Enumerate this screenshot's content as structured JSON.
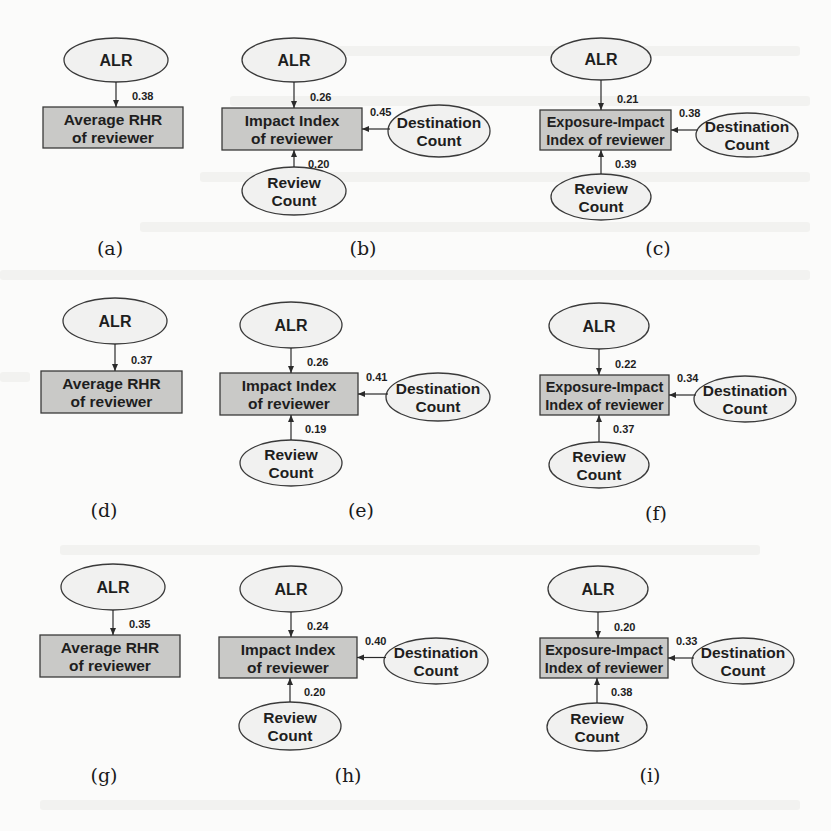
{
  "figure": {
    "colors": {
      "ellipse_fill": "#f1f1f0",
      "box_fill": "#c9c9c7",
      "stroke": "#3a3a3a",
      "text": "#1e1e1e",
      "background": "#fbfbfa"
    },
    "panels": [
      {
        "id": "a",
        "caption": "(a)",
        "outcome_lines": [
          "Average RHR",
          "of reviewer"
        ],
        "nodes": {
          "alr": "ALR"
        },
        "coefficients": {
          "alr": "0.38"
        }
      },
      {
        "id": "b",
        "caption": "(b)",
        "outcome_lines": [
          "Impact Index",
          "of reviewer"
        ],
        "nodes": {
          "alr": "ALR",
          "destination": [
            "Destination",
            "Count"
          ],
          "review": [
            "Review",
            "Count"
          ]
        },
        "coefficients": {
          "alr": "0.26",
          "destination": "0.45",
          "review": "0.20"
        }
      },
      {
        "id": "c",
        "caption": "(c)",
        "outcome_lines": [
          "Exposure-Impact",
          "Index of reviewer"
        ],
        "nodes": {
          "alr": "ALR",
          "destination": [
            "Destination",
            "Count"
          ],
          "review": [
            "Review",
            "Count"
          ]
        },
        "coefficients": {
          "alr": "0.21",
          "destination": "0.38",
          "review": "0.39"
        }
      },
      {
        "id": "d",
        "caption": "(d)",
        "outcome_lines": [
          "Average RHR",
          "of reviewer"
        ],
        "nodes": {
          "alr": "ALR"
        },
        "coefficients": {
          "alr": "0.37"
        }
      },
      {
        "id": "e",
        "caption": "(e)",
        "outcome_lines": [
          "Impact Index",
          "of reviewer"
        ],
        "nodes": {
          "alr": "ALR",
          "destination": [
            "Destination",
            "Count"
          ],
          "review": [
            "Review",
            "Count"
          ]
        },
        "coefficients": {
          "alr": "0.26",
          "destination": "0.41",
          "review": "0.19"
        }
      },
      {
        "id": "f",
        "caption": "(f)",
        "outcome_lines": [
          "Exposure-Impact",
          "Index of reviewer"
        ],
        "nodes": {
          "alr": "ALR",
          "destination": [
            "Destination",
            "Count"
          ],
          "review": [
            "Review",
            "Count"
          ]
        },
        "coefficients": {
          "alr": "0.22",
          "destination": "0.34",
          "review": "0.37"
        }
      },
      {
        "id": "g",
        "caption": "(g)",
        "outcome_lines": [
          "Average RHR",
          "of reviewer"
        ],
        "nodes": {
          "alr": "ALR"
        },
        "coefficients": {
          "alr": "0.35"
        }
      },
      {
        "id": "h",
        "caption": "(h)",
        "outcome_lines": [
          "Impact Index",
          "of reviewer"
        ],
        "nodes": {
          "alr": "ALR",
          "destination": [
            "Destination",
            "Count"
          ],
          "review": [
            "Review",
            "Count"
          ]
        },
        "coefficients": {
          "alr": "0.24",
          "destination": "0.40",
          "review": "0.20"
        }
      },
      {
        "id": "i",
        "caption": "(i)",
        "outcome_lines": [
          "Exposure-Impact",
          "Index of reviewer"
        ],
        "nodes": {
          "alr": "ALR",
          "destination": [
            "Destination",
            "Count"
          ],
          "review": [
            "Review",
            "Count"
          ]
        },
        "coefficients": {
          "alr": "0.20",
          "destination": "0.33",
          "review": "0.38"
        }
      }
    ]
  }
}
